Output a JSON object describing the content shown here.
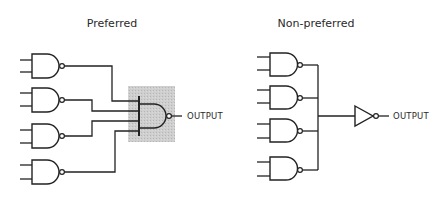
{
  "diagrams": {
    "preferred": {
      "title": "Preferred",
      "output_label": "OUTPUT",
      "highlight_color": "#c8c8c8",
      "input_gates": 4,
      "input_gate_type": "NAND",
      "combining_gate_type": "NAND (wide-input, highlighted)"
    },
    "non_preferred": {
      "title": "Non-preferred",
      "output_label": "OUTPUT",
      "input_gates": 4,
      "input_gate_type": "NAND",
      "combining_element": "wired-connection into inverter"
    }
  }
}
